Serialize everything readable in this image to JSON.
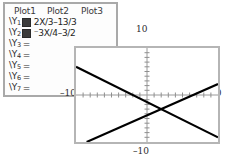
{
  "editor": {
    "tabs": [
      {
        "label": "Plot1"
      },
      {
        "label": "Plot2"
      },
      {
        "label": "Plot3"
      }
    ],
    "functions": [
      {
        "name": "\\Y",
        "index": "1",
        "selected": true,
        "expression": "2X/3–13/3"
      },
      {
        "name": "\\Y",
        "index": "2",
        "selected": true,
        "expression": "⁻3X/4–3/2"
      },
      {
        "name": "\\Y",
        "index": "3",
        "selected": false,
        "expression": ""
      },
      {
        "name": "\\Y",
        "index": "4",
        "selected": false,
        "expression": ""
      },
      {
        "name": "\\Y",
        "index": "5",
        "selected": false,
        "expression": ""
      },
      {
        "name": "\\Y",
        "index": "6",
        "selected": false,
        "expression": ""
      },
      {
        "name": "\\Y",
        "index": "7",
        "selected": false,
        "expression": ""
      }
    ],
    "equals_sign": "="
  },
  "graph": {
    "labels": {
      "top": "10",
      "left": "–10",
      "right": "10",
      "bottom": "–10"
    }
  },
  "chart_data": {
    "type": "line",
    "title": "",
    "xlabel": "",
    "ylabel": "",
    "xlim": [
      -10,
      10
    ],
    "ylim": [
      -10,
      10
    ],
    "xticks": [
      -9,
      -8,
      -7,
      -6,
      -5,
      -4,
      -3,
      -2,
      -1,
      1,
      2,
      3,
      4,
      5,
      6,
      7,
      8,
      9
    ],
    "yticks": [
      -9,
      -8,
      -7,
      -6,
      -5,
      -4,
      -3,
      -2,
      -1,
      1,
      2,
      3,
      4,
      5,
      6,
      7,
      8,
      9
    ],
    "grid": false,
    "legend": "none",
    "axis_labels": {
      "x_left": "–10",
      "x_right": "10",
      "y_top": "10",
      "y_bottom": "–10"
    },
    "series": [
      {
        "name": "Y1",
        "equation": "2X/3–13/3",
        "slope": 0.6667,
        "intercept": -4.3333,
        "points": [
          [
            -10,
            -11.0
          ],
          [
            10,
            2.3333
          ]
        ],
        "color": "#000000"
      },
      {
        "name": "Y2",
        "equation": "⁻3X/4–3/2",
        "slope": -0.75,
        "intercept": -1.5,
        "points": [
          [
            -10,
            6.0
          ],
          [
            10,
            -9.0
          ]
        ],
        "color": "#000000"
      }
    ],
    "intersection": [
      2.0,
      -3.0
    ]
  }
}
